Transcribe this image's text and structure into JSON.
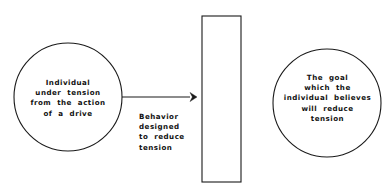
{
  "diagram": {
    "background_color": "#ffffff",
    "stroke_color": "#1a1a1a",
    "text_color": "#111111",
    "nodes": {
      "left_circle": {
        "shape": "circle",
        "label_lines": [
          "Individual",
          "under  tension",
          "from  the  action",
          "of  a  drive"
        ],
        "text": "Individual\nunder  tension\nfrom  the  action\nof  a  drive",
        "center_x": 68,
        "center_y": 97,
        "radius": 54
      },
      "barrier_rectangle": {
        "shape": "rectangle",
        "text": "",
        "x": 202,
        "y": 16,
        "width": 39,
        "height": 166
      },
      "right_circle": {
        "shape": "circle",
        "label_lines": [
          "The  goal",
          "which  the",
          "individual  believes",
          "will  reduce",
          "tension"
        ],
        "text": "The  goal\nwhich  the\nindividual  believes\nwill  reduce\ntension",
        "center_x": 327,
        "center_y": 103,
        "radius": 54
      }
    },
    "connector": {
      "type": "arrow",
      "direction": "left-to-right",
      "from": "left_circle",
      "to": "barrier_rectangle",
      "start_x": 122,
      "start_y": 97,
      "end_x": 196,
      "end_y": 97,
      "label_lines": [
        "Behavior",
        "designed",
        "to  reduce",
        "tension"
      ],
      "label": "Behavior\ndesigned\nto  reduce\ntension"
    }
  }
}
